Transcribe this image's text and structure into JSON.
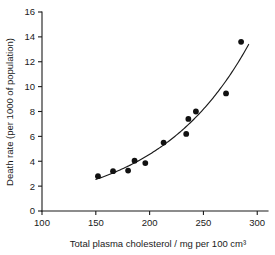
{
  "chart_data": {
    "type": "scatter",
    "title": "",
    "subtitle": "",
    "xlabel": "Total plasma cholesterol / mg per 100 cm³",
    "ylabel": "Death rate (per 1000 of population)",
    "xlim": [
      100,
      310
    ],
    "ylim": [
      0,
      16
    ],
    "xticks": [
      100,
      150,
      200,
      250,
      300
    ],
    "xticklabels": [
      "100",
      "150",
      "200",
      "250",
      "300"
    ],
    "yticks": [
      0,
      2,
      4,
      6,
      8,
      10,
      12,
      14,
      16
    ],
    "yticklabels": [
      "0",
      "2",
      "4",
      "6",
      "8",
      "10",
      "12",
      "14",
      "16"
    ],
    "grid": false,
    "legend": false,
    "legend_position": "none",
    "marker": "filled-circle",
    "marker_color": "#111111",
    "curve_color": "#1a1a1a",
    "has_fitted_curve": true,
    "fitted_curve_label": "exponential best-fit line",
    "fitted_curve_x_range": [
      150,
      292
    ],
    "points": [
      {
        "x": 152,
        "y": 2.8
      },
      {
        "x": 166,
        "y": 3.2
      },
      {
        "x": 180,
        "y": 3.25
      },
      {
        "x": 186,
        "y": 4.05
      },
      {
        "x": 196,
        "y": 3.85
      },
      {
        "x": 213,
        "y": 5.5
      },
      {
        "x": 234,
        "y": 6.2
      },
      {
        "x": 236,
        "y": 7.4
      },
      {
        "x": 243,
        "y": 8.0
      },
      {
        "x": 271,
        "y": 9.45
      },
      {
        "x": 285,
        "y": 13.6
      }
    ],
    "series": [
      {
        "name": "Death rate vs plasma cholesterol",
        "x": [
          152,
          166,
          180,
          186,
          196,
          213,
          234,
          236,
          243,
          271,
          285
        ],
        "values": [
          2.8,
          3.2,
          3.25,
          4.05,
          3.85,
          5.5,
          6.2,
          7.4,
          8.0,
          9.45,
          13.6
        ]
      }
    ]
  }
}
